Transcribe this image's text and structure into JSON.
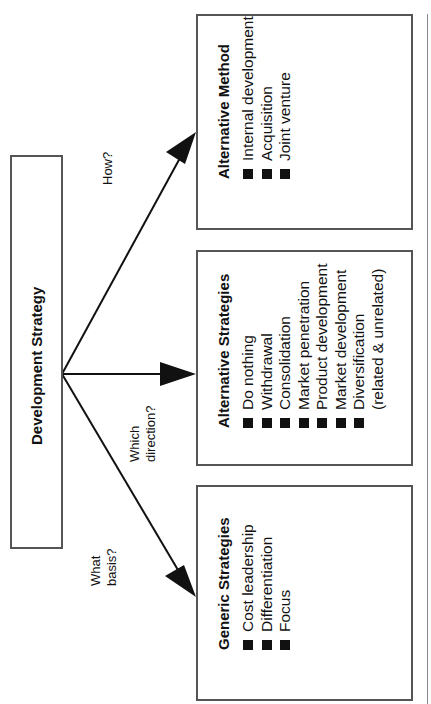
{
  "root": {
    "title": "Development Strategy"
  },
  "questions": {
    "how": "How?",
    "which_line1": "Which",
    "which_line2": "direction?",
    "what_line1": "What",
    "what_line2": "basis?"
  },
  "boxes": [
    {
      "title": "Alternative Method",
      "items": [
        "Internal development",
        "Acquisition",
        "Joint venture"
      ]
    },
    {
      "title": "Alternative Strategies",
      "items": [
        "Do nothing",
        "Withdrawal",
        "Consolidation",
        "Market penetration",
        "Product development",
        "Market development",
        "Diversification"
      ],
      "continuation": "(related & unrelated)"
    },
    {
      "title": "Generic Strategies",
      "items": [
        "Cost leadership",
        "Differentiation",
        "Focus"
      ]
    }
  ],
  "colors": {
    "border": "#555555",
    "arrow": "#111111",
    "bullet": "#111111"
  }
}
